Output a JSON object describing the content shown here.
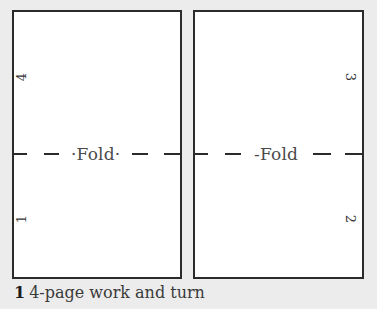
{
  "diagram": {
    "panels": [
      {
        "id": "left",
        "fold_label": "·Fold·",
        "page_numbers": [
          {
            "value": "4",
            "position": "upper",
            "rotation": "counter-clockwise"
          },
          {
            "value": "1",
            "position": "lower",
            "rotation": "counter-clockwise"
          }
        ]
      },
      {
        "id": "right",
        "fold_label": "-Fold",
        "page_numbers": [
          {
            "value": "3",
            "position": "upper",
            "rotation": "clockwise"
          },
          {
            "value": "2",
            "position": "lower",
            "rotation": "clockwise"
          }
        ]
      }
    ],
    "fold_line_style": "dashed"
  },
  "caption": {
    "figure_number": "1",
    "text": "4-page work and turn"
  },
  "colors": {
    "background": "#ececec",
    "panel_fill": "#ffffff",
    "stroke": "#2b2b2b"
  }
}
